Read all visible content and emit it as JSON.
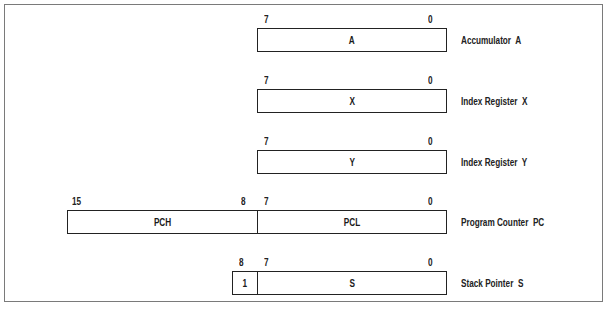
{
  "diagram": {
    "registers": [
      {
        "id": "A",
        "description": "Accumulator  A",
        "fields": [
          {
            "name": "A",
            "high_bit": "7",
            "low_bit": "0"
          }
        ]
      },
      {
        "id": "X",
        "description": "Index Register  X",
        "fields": [
          {
            "name": "X",
            "high_bit": "7",
            "low_bit": "0"
          }
        ]
      },
      {
        "id": "Y",
        "description": "Index Register  Y",
        "fields": [
          {
            "name": "Y",
            "high_bit": "7",
            "low_bit": "0"
          }
        ]
      },
      {
        "id": "PC",
        "description": "Program Counter  PC",
        "fields": [
          {
            "name": "PCH",
            "high_bit": "15",
            "low_bit": "8"
          },
          {
            "name": "PCL",
            "high_bit": "7",
            "low_bit": "0"
          }
        ]
      },
      {
        "id": "S",
        "description": "Stack Pointer  S",
        "fields": [
          {
            "name": "1",
            "high_bit": "8"
          },
          {
            "name": "S",
            "high_bit": "7",
            "low_bit": "0"
          }
        ]
      }
    ]
  },
  "colors": {
    "frame": "#7a7a7a",
    "box_stroke": "#222222",
    "background": "#ffffff"
  }
}
